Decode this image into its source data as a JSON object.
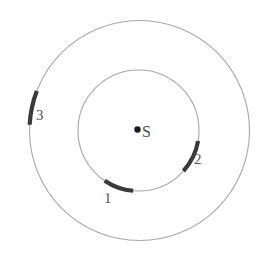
{
  "diagram": {
    "background_color": "#ffffff",
    "center": {
      "x": 139,
      "y": 130.5
    },
    "orbit_color": "#a8a8a8",
    "orbit_stroke_width": 1.1,
    "segment_color": "#3a3a3a",
    "segment_stroke_width": 4.2,
    "center_body": {
      "label": "S",
      "dot_color": "#1a1a1a",
      "dot_radius": 3.2,
      "dot_x": 137.5,
      "dot_y": 129.5
    },
    "orbits": [
      {
        "name": "inner-orbit",
        "radius": 60.5,
        "cx": 138.5,
        "cy": 130.5
      },
      {
        "name": "outer-orbit",
        "radius": 110,
        "cx": 139.5,
        "cy": 130.5
      }
    ],
    "segments": [
      {
        "label": "1",
        "orbit": "inner-orbit",
        "radius": 60.5,
        "cx": 138.5,
        "cy": 130.5,
        "start_angle_deg": 95,
        "end_angle_deg": 124,
        "label_x": 104,
        "label_y": 191
      },
      {
        "label": "2",
        "orbit": "inner-orbit",
        "radius": 60.5,
        "cx": 138.5,
        "cy": 130.5,
        "start_angle_deg": 10,
        "end_angle_deg": 42,
        "label_x": 194,
        "label_y": 152
      },
      {
        "label": "3",
        "orbit": "outer-orbit",
        "radius": 110,
        "cx": 139.5,
        "cy": 130.5,
        "start_angle_deg": 183,
        "end_angle_deg": 201,
        "label_x": 36,
        "label_y": 108
      }
    ]
  }
}
